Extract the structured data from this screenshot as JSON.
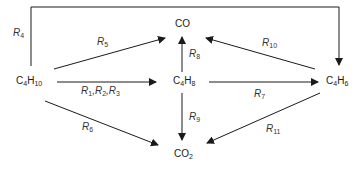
{
  "diagram": {
    "type": "reaction-network",
    "nodes": {
      "c4h10": {
        "base": "C",
        "n1": "4",
        "mid": "H",
        "n2": "10"
      },
      "c4h8": {
        "base": "C",
        "n1": "4",
        "mid": "H",
        "n2": "8"
      },
      "c4h6": {
        "base": "C",
        "n1": "4",
        "mid": "H",
        "n2": "6"
      },
      "co": {
        "label": "CO"
      },
      "co2": {
        "base": "CO",
        "n1": "2"
      }
    },
    "reactions": {
      "r123": {
        "a": "R",
        "a_sub": "1",
        "sep1": ",",
        "b": "R",
        "b_sub": "2",
        "sep2": ",",
        "c": "R",
        "c_sub": "3"
      },
      "r4": {
        "r": "R",
        "sub": "4"
      },
      "r5": {
        "r": "R",
        "sub": "5"
      },
      "r6": {
        "r": "R",
        "sub": "6"
      },
      "r7": {
        "r": "R",
        "sub": "7"
      },
      "r8": {
        "r": "R",
        "sub": "8"
      },
      "r9": {
        "r": "R",
        "sub": "9"
      },
      "r10": {
        "r": "R",
        "sub": "10"
      },
      "r11": {
        "r": "R",
        "sub": "11"
      }
    },
    "edges": [
      {
        "from": "C4H10",
        "to": "C4H8",
        "label": "R1,R2,R3"
      },
      {
        "from": "C4H10",
        "to": "C4H6",
        "label": "R4"
      },
      {
        "from": "C4H10",
        "to": "CO",
        "label": "R5"
      },
      {
        "from": "C4H10",
        "to": "CO2",
        "label": "R6"
      },
      {
        "from": "C4H8",
        "to": "C4H6",
        "label": "R7"
      },
      {
        "from": "C4H8",
        "to": "CO",
        "label": "R8"
      },
      {
        "from": "C4H8",
        "to": "CO2",
        "label": "R9"
      },
      {
        "from": "C4H6",
        "to": "CO",
        "label": "R10"
      },
      {
        "from": "C4H6",
        "to": "CO2",
        "label": "R11"
      }
    ],
    "colors": {
      "line": "#1a1a1a",
      "text": "#1a1a1a"
    }
  }
}
